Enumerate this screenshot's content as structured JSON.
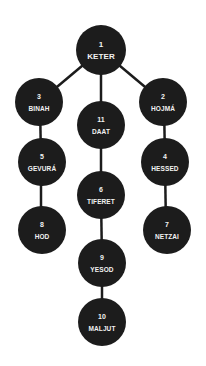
{
  "diagram": {
    "title": "",
    "colors": {
      "node_fill": "#1c1c1c",
      "node_text": "#f2f2f2",
      "edge": "#1c1c1c",
      "background": "#ffffff"
    },
    "nodes": [
      {
        "id": "keter",
        "number": "1",
        "label": "KETER",
        "x": 101,
        "y": 50
      },
      {
        "id": "hojma",
        "number": "2",
        "label": "HOJMÁ",
        "x": 163,
        "y": 102
      },
      {
        "id": "binah",
        "number": "3",
        "label": "BINAH",
        "x": 39,
        "y": 102
      },
      {
        "id": "hessed",
        "number": "4",
        "label": "HESSED",
        "x": 165,
        "y": 162
      },
      {
        "id": "gevura",
        "number": "5",
        "label": "GEVURÁ",
        "x": 42,
        "y": 162
      },
      {
        "id": "tiferet",
        "number": "6",
        "label": "TIFERET",
        "x": 101,
        "y": 195
      },
      {
        "id": "netzai",
        "number": "7",
        "label": "NETZAI",
        "x": 167,
        "y": 230
      },
      {
        "id": "hod",
        "number": "8",
        "label": "HOD",
        "x": 42,
        "y": 230
      },
      {
        "id": "yesod",
        "number": "9",
        "label": "YESOD",
        "x": 102,
        "y": 263
      },
      {
        "id": "maljut",
        "number": "10",
        "label": "MALJUT",
        "x": 102,
        "y": 322
      },
      {
        "id": "daat",
        "number": "11",
        "label": "DAAT",
        "x": 101,
        "y": 125
      }
    ],
    "edges": [
      [
        "keter",
        "binah"
      ],
      [
        "keter",
        "hojma"
      ],
      [
        "keter",
        "daat"
      ],
      [
        "binah",
        "gevura"
      ],
      [
        "gevura",
        "hod"
      ],
      [
        "hojma",
        "hessed"
      ],
      [
        "hessed",
        "netzai"
      ],
      [
        "daat",
        "tiferet"
      ],
      [
        "tiferet",
        "yesod"
      ],
      [
        "yesod",
        "maljut"
      ]
    ]
  }
}
